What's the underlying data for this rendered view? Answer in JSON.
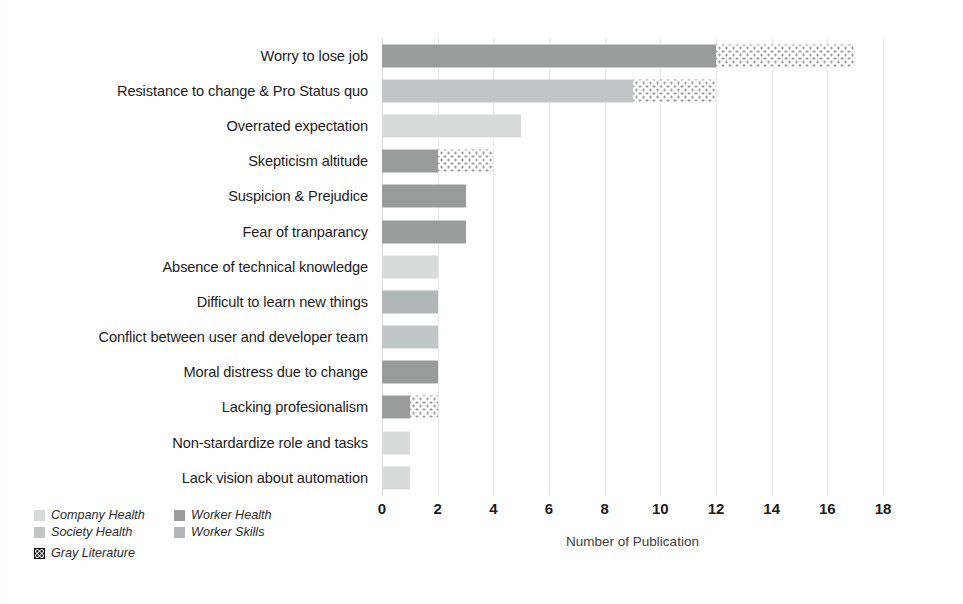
{
  "chart_data": {
    "type": "bar",
    "orientation": "horizontal",
    "stacked": true,
    "title": "",
    "xlabel": "Number of Publication",
    "ylabel": "",
    "xlim": [
      0,
      18
    ],
    "xticks": [
      0,
      2,
      4,
      6,
      8,
      10,
      12,
      14,
      16,
      18
    ],
    "grid": true,
    "legend_position": "bottom-left",
    "categories": [
      "Worry to lose job",
      "Resistance to change & Pro Status quo",
      "Overrated expectation",
      "Skepticism altitude",
      "Suspicion & Prejudice",
      "Fear of tranparancy",
      "Absence of technical knowledge",
      "Difficult to learn new things",
      "Conflict between user and developer team",
      "Moral distress due to change",
      "Lacking profesionalism",
      "Non-stardardize role and tasks",
      "Lack vision about automation"
    ],
    "series": [
      {
        "name": "Company Health",
        "color": "#d9dbdb",
        "values": [
          0,
          0,
          5,
          0,
          0,
          0,
          2,
          0,
          0,
          0,
          0,
          1,
          1
        ]
      },
      {
        "name": "Worker Health",
        "color": "#9a9c9c",
        "values": [
          12,
          0,
          0,
          2,
          3,
          3,
          0,
          0,
          0,
          2,
          1,
          0,
          0
        ]
      },
      {
        "name": "Society Health",
        "color": "#c3c6c6",
        "values": [
          0,
          9,
          0,
          0,
          0,
          0,
          0,
          0,
          2,
          0,
          0,
          0,
          0
        ]
      },
      {
        "name": "Worker Skills",
        "color": "#b3b6b6",
        "values": [
          0,
          0,
          0,
          0,
          0,
          0,
          0,
          2,
          0,
          0,
          0,
          0,
          0
        ]
      },
      {
        "name": "Gray Literature",
        "color": "#ffffff",
        "values": [
          5,
          3,
          0,
          2,
          0,
          0,
          0,
          0,
          0,
          0,
          1,
          0,
          0
        ]
      }
    ],
    "totals": [
      17,
      12,
      5,
      4,
      3,
      3,
      2,
      2,
      2,
      2,
      2,
      1,
      1
    ],
    "rows": [
      {
        "label": "Worry to lose job",
        "segments": [
          {
            "series": "Worker Health",
            "value": 12
          },
          {
            "series": "Gray Literature",
            "value": 5
          }
        ]
      },
      {
        "label": "Resistance to change & Pro Status quo",
        "segments": [
          {
            "series": "Society Health",
            "value": 9
          },
          {
            "series": "Gray Literature",
            "value": 3
          }
        ]
      },
      {
        "label": "Overrated expectation",
        "segments": [
          {
            "series": "Company Health",
            "value": 5
          }
        ]
      },
      {
        "label": "Skepticism altitude",
        "segments": [
          {
            "series": "Worker Health",
            "value": 2
          },
          {
            "series": "Gray Literature",
            "value": 2
          }
        ]
      },
      {
        "label": "Suspicion & Prejudice",
        "segments": [
          {
            "series": "Worker Health",
            "value": 3
          }
        ]
      },
      {
        "label": "Fear of tranparancy",
        "segments": [
          {
            "series": "Worker Health",
            "value": 3
          }
        ]
      },
      {
        "label": "Absence of technical knowledge",
        "segments": [
          {
            "series": "Company Health",
            "value": 2
          }
        ]
      },
      {
        "label": "Difficult to learn new things",
        "segments": [
          {
            "series": "Worker Skills",
            "value": 2
          }
        ]
      },
      {
        "label": "Conflict between user and developer team",
        "segments": [
          {
            "series": "Society Health",
            "value": 2
          }
        ]
      },
      {
        "label": "Moral distress due to change",
        "segments": [
          {
            "series": "Worker Health",
            "value": 2
          }
        ]
      },
      {
        "label": "Lacking profesionalism",
        "segments": [
          {
            "series": "Worker Health",
            "value": 1
          },
          {
            "series": "Gray Literature",
            "value": 1
          }
        ]
      },
      {
        "label": "Non-stardardize role and tasks",
        "segments": [
          {
            "series": "Company Health",
            "value": 1
          }
        ]
      },
      {
        "label": "Lack vision about automation",
        "segments": [
          {
            "series": "Company Health",
            "value": 1
          }
        ]
      }
    ]
  },
  "legend": {
    "items": [
      {
        "label": "Company Health",
        "swatch": "fill-company"
      },
      {
        "label": "Worker Health",
        "swatch": "fill-worker-h"
      },
      {
        "label": "Society Health",
        "swatch": "fill-society"
      },
      {
        "label": "Worker Skills",
        "swatch": "fill-worker-s"
      },
      {
        "label": "Gray Literature",
        "swatch": "fill-gray-lit"
      }
    ]
  }
}
